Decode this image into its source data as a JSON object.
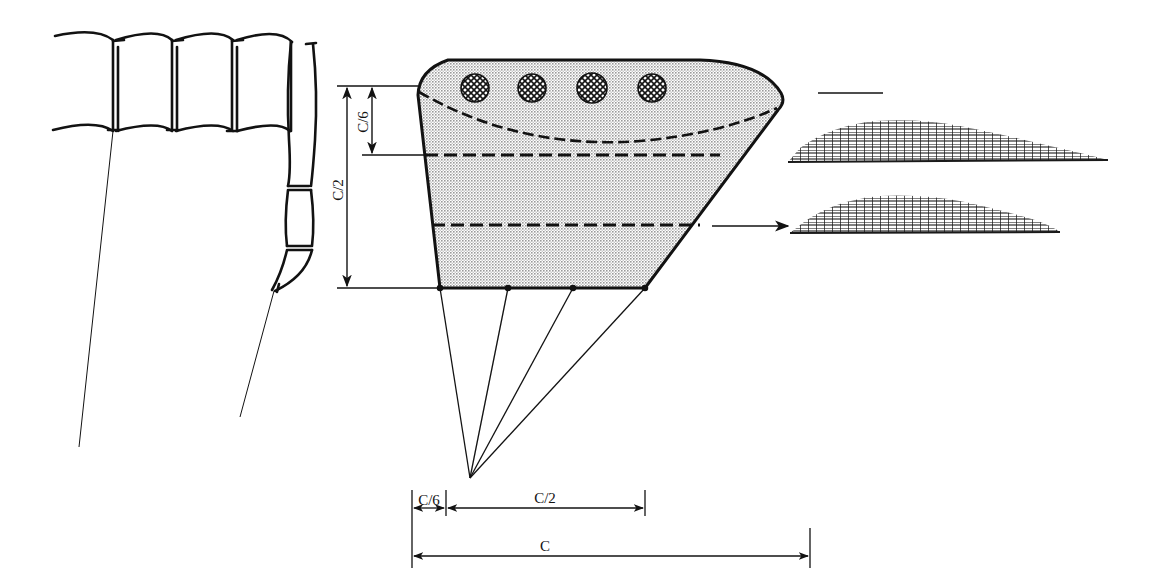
{
  "figure": {
    "kind": "engineering-diagram",
    "background_color": "#ffffff",
    "line_color": "#121212",
    "planform_fill": "#b5b5b5"
  },
  "dimensions": {
    "vertical": [
      {
        "id": "c-over-6",
        "label": "C/6",
        "orientation": "vertical",
        "from_y": 86,
        "to_y": 155,
        "x": 372
      },
      {
        "id": "c-over-2",
        "label": "C/2",
        "orientation": "vertical",
        "from_y": 86,
        "to_y": 288,
        "x": 347
      }
    ],
    "horizontal": [
      {
        "id": "c-over-6-h",
        "label": "C/6",
        "orientation": "horizontal",
        "from_x": 412,
        "to_x": 446,
        "y": 508
      },
      {
        "id": "c-over-2-h",
        "label": "C/2",
        "orientation": "horizontal",
        "from_x": 446,
        "to_x": 645,
        "y": 508
      },
      {
        "id": "c-h",
        "label": "C",
        "orientation": "horizontal",
        "from_x": 412,
        "to_x": 810,
        "y": 552
      }
    ]
  },
  "planform": {
    "name": "wing-planform",
    "station_lines": 3,
    "station_line_style": "dashed",
    "curved_station_label": "leading-edge station curve",
    "marker_circles": 4,
    "marker_fill": "cross-hatch",
    "projection_lines": 4,
    "projection_apex": {
      "x": 470,
      "y": 478
    },
    "root_chord_y": 288,
    "tip_x": 783
  },
  "sections": [
    {
      "id": "airfoil-section-upper",
      "hatch": "grid-mesh",
      "tip_of_leader": "wing-tip"
    },
    {
      "id": "airfoil-section-lower",
      "hatch": "grid-mesh",
      "tip_of_leader": "mid-span-station"
    }
  ],
  "developed_surface": {
    "name": "developed-panel-strip",
    "panel_count": 5,
    "tail_panel_count": 3,
    "tick_lines": 2
  },
  "leaders": [
    {
      "id": "leader-tip",
      "type": "plain-line",
      "from_x": 818,
      "from_y": 93,
      "to_x": 883,
      "to_y": 93
    },
    {
      "id": "leader-mid",
      "type": "arrow",
      "from_x": 712,
      "from_y": 226,
      "to_x": 788,
      "to_y": 226
    }
  ]
}
